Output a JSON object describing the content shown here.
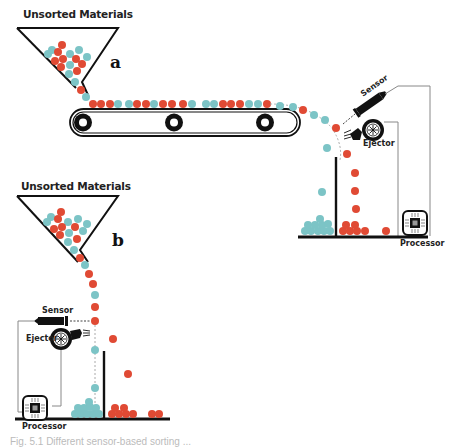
{
  "colors": {
    "red_material": "#e04a34",
    "blue_material": "#7cc4c6",
    "line": "#111111",
    "wire": "#888888"
  },
  "panel_a": {
    "title": "Unsorted Materials",
    "letter": "a",
    "sensor_label": "Sensor",
    "ejector_label": "Ejector",
    "processor_label": "Processor"
  },
  "panel_b": {
    "title": "Unsorted Materials",
    "letter": "b",
    "sensor_label": "Sensor",
    "ejector_label": "Ejector",
    "processor_label": "Processor"
  },
  "caption": {
    "text": "Fig. 5.1 Different sensor-based sorting ..."
  },
  "legend": {
    "icons": [
      "hopper-icon",
      "conveyor-belt-icon",
      "sensor-icon",
      "ejector-fan-icon",
      "processor-chip-icon"
    ]
  }
}
